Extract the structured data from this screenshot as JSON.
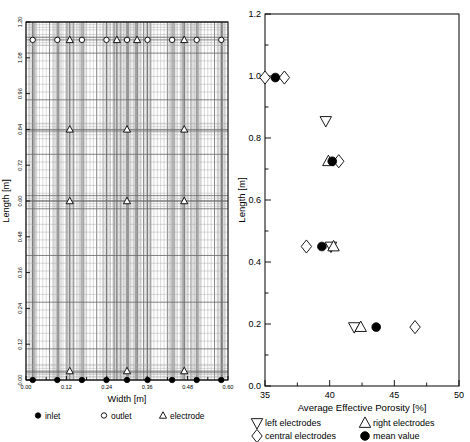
{
  "figure": {
    "panels": [
      "reactor-layout",
      "porosity-profile"
    ]
  },
  "chart_data": [
    {
      "id": "reactor-layout",
      "type": "scatter",
      "title": "",
      "xlabel": "Width [m]",
      "ylabel": "Length [m]",
      "xlim": [
        0.0,
        0.6
      ],
      "ylim": [
        0.0,
        1.2
      ],
      "xticks": [
        "0.00",
        "0.12",
        "0.24",
        "0.36",
        "0.48",
        "0.60"
      ],
      "xtick_values": [
        0.0,
        0.12,
        0.24,
        0.36,
        0.48,
        0.6
      ],
      "yticks": [
        "0.00",
        "0.12",
        "0.24",
        "0.36",
        "0.48",
        "0.60",
        "0.72",
        "0.84",
        "0.96",
        "1.08",
        "1.20"
      ],
      "ytick_values": [
        0.0,
        0.12,
        0.24,
        0.36,
        0.48,
        0.6,
        0.72,
        0.84,
        0.96,
        1.08,
        1.2
      ],
      "grid": "on",
      "grid_style": "non-uniform structured mesh, refined near wells",
      "legend_position": "below-axes",
      "series": [
        {
          "name": "inlet",
          "marker": "filled-circle",
          "points": [
            {
              "x": 0.02,
              "y": 0.0
            },
            {
              "x": 0.093,
              "y": 0.0
            },
            {
              "x": 0.166,
              "y": 0.0
            },
            {
              "x": 0.239,
              "y": 0.0
            },
            {
              "x": 0.3,
              "y": 0.0
            },
            {
              "x": 0.361,
              "y": 0.0
            },
            {
              "x": 0.434,
              "y": 0.0
            },
            {
              "x": 0.507,
              "y": 0.0
            },
            {
              "x": 0.58,
              "y": 0.0
            }
          ]
        },
        {
          "name": "outlet",
          "marker": "open-circle",
          "points": [
            {
              "x": 0.02,
              "y": 1.14
            },
            {
              "x": 0.093,
              "y": 1.14
            },
            {
              "x": 0.166,
              "y": 1.14
            },
            {
              "x": 0.239,
              "y": 1.14
            },
            {
              "x": 0.3,
              "y": 1.14
            },
            {
              "x": 0.361,
              "y": 1.14
            },
            {
              "x": 0.434,
              "y": 1.14
            },
            {
              "x": 0.507,
              "y": 1.14
            },
            {
              "x": 0.58,
              "y": 1.14
            }
          ]
        },
        {
          "name": "electrode",
          "marker": "open-triangle-up",
          "points": [
            {
              "x": 0.13,
              "y": 1.14
            },
            {
              "x": 0.27,
              "y": 1.14
            },
            {
              "x": 0.33,
              "y": 1.14
            },
            {
              "x": 0.47,
              "y": 1.14
            },
            {
              "x": 0.13,
              "y": 0.84
            },
            {
              "x": 0.3,
              "y": 0.84
            },
            {
              "x": 0.47,
              "y": 0.84
            },
            {
              "x": 0.13,
              "y": 0.6
            },
            {
              "x": 0.3,
              "y": 0.6
            },
            {
              "x": 0.47,
              "y": 0.6
            },
            {
              "x": 0.13,
              "y": 0.03
            },
            {
              "x": 0.3,
              "y": 0.03
            },
            {
              "x": 0.47,
              "y": 0.03
            }
          ]
        }
      ],
      "legend": [
        {
          "label": "inlet",
          "marker": "filled-circle"
        },
        {
          "label": "outlet",
          "marker": "open-circle"
        },
        {
          "label": "electrode",
          "marker": "open-triangle-up"
        }
      ]
    },
    {
      "id": "porosity-profile",
      "type": "scatter",
      "title": "",
      "xlabel": "Average Effective Porosity [%]",
      "ylabel": "Length [m]",
      "xlim": [
        35,
        50
      ],
      "ylim": [
        0.0,
        1.2
      ],
      "xticks": [
        "35",
        "40",
        "45",
        "50"
      ],
      "xtick_values": [
        35,
        40,
        45,
        50
      ],
      "yticks": [
        "0.0",
        "0.2",
        "0.4",
        "0.6",
        "0.8",
        "1.0",
        "1.2"
      ],
      "ytick_values": [
        0.0,
        0.2,
        0.4,
        0.6,
        0.8,
        1.0,
        1.2
      ],
      "minor_yticks": [
        0.1,
        0.3,
        0.5,
        0.7,
        0.9,
        1.1
      ],
      "grid": "off",
      "legend_position": "below-axes",
      "series": [
        {
          "name": "left electrodes",
          "marker": "open-triangle-down",
          "points": [
            {
              "x": 41.9,
              "y": 0.19
            },
            {
              "x": 40.1,
              "y": 0.45
            },
            {
              "x": 39.7,
              "y": 0.855
            }
          ]
        },
        {
          "name": "right electrodes",
          "marker": "open-triangle-up",
          "points": [
            {
              "x": 42.4,
              "y": 0.19
            },
            {
              "x": 40.3,
              "y": 0.45
            },
            {
              "x": 39.9,
              "y": 0.725
            }
          ]
        },
        {
          "name": "central electrodes",
          "marker": "open-diamond",
          "points": [
            {
              "x": 46.6,
              "y": 0.19
            },
            {
              "x": 38.2,
              "y": 0.45
            },
            {
              "x": 40.7,
              "y": 0.725
            },
            {
              "x": 36.5,
              "y": 0.995
            },
            {
              "x": 35.0,
              "y": 0.995
            }
          ]
        },
        {
          "name": "mean value",
          "marker": "filled-circle",
          "points": [
            {
              "x": 43.6,
              "y": 0.19
            },
            {
              "x": 39.4,
              "y": 0.45
            },
            {
              "x": 40.2,
              "y": 0.725
            },
            {
              "x": 35.8,
              "y": 0.995
            }
          ]
        }
      ],
      "legend": [
        {
          "label": "left electrodes",
          "marker": "open-triangle-down"
        },
        {
          "label": "right electrodes",
          "marker": "open-triangle-up"
        },
        {
          "label": "central electrodes",
          "marker": "open-diamond"
        },
        {
          "label": "mean value",
          "marker": "filled-circle"
        }
      ]
    }
  ]
}
